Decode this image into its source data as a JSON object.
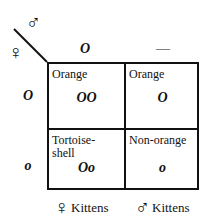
{
  "diagram": {
    "type": "punnett-square",
    "corner": {
      "top_symbol": "♂",
      "left_symbol": "♀"
    },
    "column_headers": [
      "O",
      "—"
    ],
    "row_headers": [
      "O",
      "o"
    ],
    "cells": [
      [
        {
          "phenotype": "Orange",
          "genotype": "OO"
        },
        {
          "phenotype": "Orange",
          "genotype": "O"
        }
      ],
      [
        {
          "phenotype": "Tortoise-shell",
          "phenotype_line1": "Tortoise-",
          "phenotype_line2": "shell",
          "genotype": "Oo"
        },
        {
          "phenotype": "Non-orange",
          "genotype": "o"
        }
      ]
    ],
    "footer": [
      {
        "symbol": "♀",
        "label": "Kittens"
      },
      {
        "symbol": "♂",
        "label": "Kittens"
      }
    ]
  }
}
